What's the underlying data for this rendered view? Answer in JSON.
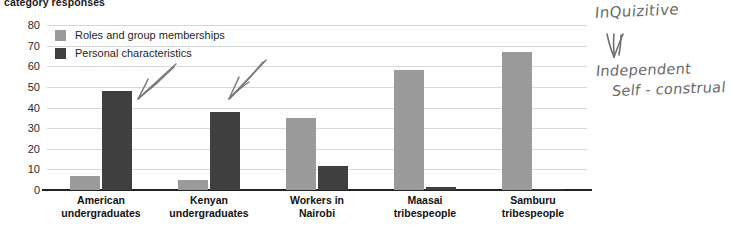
{
  "chart": {
    "title": "category responses",
    "ylabel": "",
    "xlabel": ""
  },
  "legend": {
    "items": [
      {
        "label": "Roles and group memberships",
        "swatch": "light",
        "color": "#9a9a9a"
      },
      {
        "label": "Personal characteristics",
        "swatch": "dark",
        "color": "#3f3f3f"
      }
    ]
  },
  "yaxis": {
    "ticks": [
      "80",
      "70",
      "60",
      "50",
      "40",
      "30",
      "20",
      "10",
      "0"
    ]
  },
  "annotations": {
    "handwritten": [
      {
        "name": "inquizitive-note",
        "text": "InQuizitive"
      },
      {
        "name": "independent-note",
        "text": "Independent"
      },
      {
        "name": "self-construal-note",
        "text": "Self - construal"
      }
    ],
    "arrows": [
      {
        "name": "double-down-arrow",
        "glyph": "down-arrow"
      },
      {
        "name": "pencil-arrow-left",
        "glyph": "arrow"
      },
      {
        "name": "pencil-arrow-right",
        "glyph": "arrow"
      }
    ]
  },
  "chart_data": {
    "type": "bar",
    "title": "category responses",
    "xlabel": "",
    "ylabel": "",
    "ylim": [
      0,
      80
    ],
    "ytick_step": 10,
    "grid": true,
    "legend_position": "upper-left-inside",
    "categories": [
      "American undergraduates",
      "Kenyan undergraduates",
      "Workers in Nairobi",
      "Maasai tribespeople",
      "Samburu tribespeople"
    ],
    "series": [
      {
        "name": "Roles and group memberships",
        "color": "#9a9a9a",
        "values": [
          7,
          5,
          35,
          58,
          67
        ]
      },
      {
        "name": "Personal characteristics",
        "color": "#3f3f3f",
        "values": [
          48,
          38,
          11.5,
          1.5,
          0.7
        ]
      }
    ]
  }
}
